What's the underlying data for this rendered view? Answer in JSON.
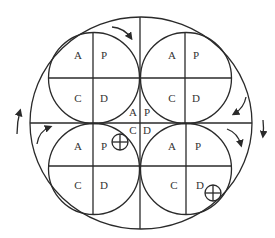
{
  "diagram": {
    "quadrant_labels": [
      "A",
      "P",
      "C",
      "D"
    ],
    "circles": [
      {
        "id": "top-left",
        "labels": {
          "tl": "A",
          "tr": "P",
          "bl": "C",
          "br": "D"
        }
      },
      {
        "id": "top-right",
        "labels": {
          "tl": "A",
          "tr": "P",
          "bl": "C",
          "br": "D"
        }
      },
      {
        "id": "bottom-left",
        "labels": {
          "tl": "A",
          "tr": "P",
          "bl": "C",
          "br": "D"
        }
      },
      {
        "id": "bottom-right",
        "labels": {
          "tl": "A",
          "tr": "P",
          "bl": "C",
          "br": "D"
        }
      }
    ],
    "center_labels": {
      "tl": "A",
      "tr": "P",
      "bl": "C",
      "br": "D"
    },
    "markers": [
      "circled-plus",
      "circled-plus"
    ],
    "line_color": "#2a2a2a",
    "background": "#ffffff"
  }
}
